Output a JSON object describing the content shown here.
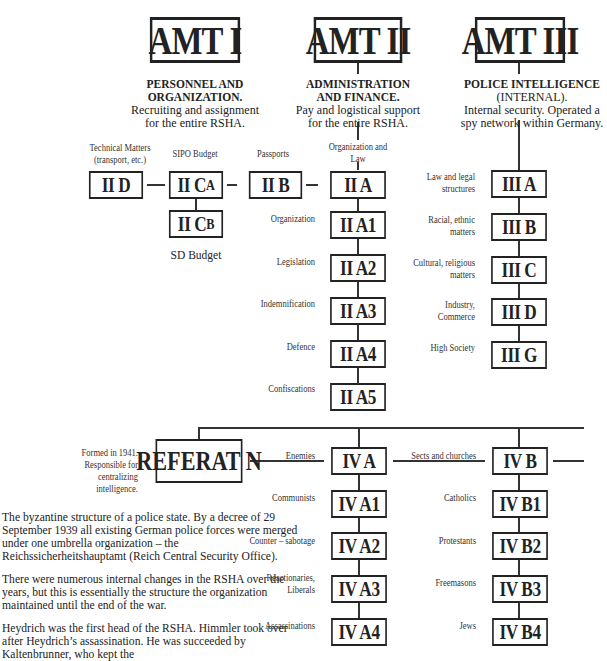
{
  "amts": [
    {
      "id": "amt1",
      "title": "AMT I",
      "heading": "PERSONNEL AND ORGANIZATION.",
      "heading_lines": [
        "PERSONNEL AND",
        "ORGANIZATION."
      ],
      "desc_lines": [
        "Recruiting and assignment",
        "for the entire RSHA."
      ]
    },
    {
      "id": "amt2",
      "title": "AMT II",
      "heading_lines": [
        "ADMINISTRATION",
        "AND FINANCE."
      ],
      "desc_lines": [
        "Pay and logistical support",
        "for the entire RSHA."
      ]
    },
    {
      "id": "amt3",
      "title": "AMT III",
      "heading_lines": [
        "POLICE INTELLIGENCE",
        "(INTERNAL)."
      ],
      "desc_lines": [
        "Internal security. Operated a",
        "spy network within Germany."
      ]
    }
  ],
  "amt2_units": {
    "row": [
      {
        "code": "II D",
        "label_lines": [
          "Technical Matters",
          "(transport, etc.)"
        ]
      },
      {
        "code": "II C",
        "sub": "A",
        "label_lines": [
          "SIPO Budget"
        ]
      },
      {
        "code": "II B",
        "label_lines": [
          "Passports"
        ]
      },
      {
        "code": "II A",
        "label_lines": [
          "Organization and",
          "Law"
        ]
      }
    ],
    "cb": {
      "code": "II C",
      "sub": "B",
      "label": "SD Budget"
    },
    "a_column": [
      {
        "code": "II A1",
        "label": "Organization"
      },
      {
        "code": "II A2",
        "label": "Legislation"
      },
      {
        "code": "II A3",
        "label": "Indemnification"
      },
      {
        "code": "II A4",
        "label": "Defence"
      },
      {
        "code": "II A5",
        "label": "Confiscations"
      }
    ]
  },
  "amt3_units": [
    {
      "code": "III A",
      "label_lines": [
        "Law and legal",
        "structures"
      ]
    },
    {
      "code": "III B",
      "label_lines": [
        "Racial, ethnic",
        "matters"
      ]
    },
    {
      "code": "III C",
      "label_lines": [
        "Cultural, religious",
        "matters"
      ]
    },
    {
      "code": "III D",
      "label_lines": [
        "Industry,",
        "Commerce"
      ]
    },
    {
      "code": "III G",
      "label_lines": [
        "High Society"
      ]
    }
  ],
  "referat": {
    "title": "REFERAT N",
    "note_lines": [
      "Formed in 1941.",
      "Responsible for centralizing",
      "intelligence."
    ]
  },
  "amt4_units": {
    "a": {
      "code": "IV A",
      "label": "Enemies",
      "children": [
        {
          "code": "IV A1",
          "label_lines": [
            "Communists"
          ]
        },
        {
          "code": "IV A2",
          "label_lines": [
            "Counter – sabotage"
          ]
        },
        {
          "code": "IV A3",
          "label_lines": [
            "Reactionaries,",
            "Liberals"
          ]
        },
        {
          "code": "IV A4",
          "label_lines": [
            "Assassinations"
          ]
        }
      ]
    },
    "b": {
      "code": "IV B",
      "label": "Sects and churches",
      "children": [
        {
          "code": "IV B1",
          "label_lines": [
            "Catholics"
          ]
        },
        {
          "code": "IV B2",
          "label_lines": [
            "Protestants"
          ]
        },
        {
          "code": "IV B3",
          "label_lines": [
            "Freemasons"
          ]
        },
        {
          "code": "IV B4",
          "label_lines": [
            "Jews"
          ]
        }
      ]
    }
  },
  "caption": {
    "paragraphs": [
      "The byzantine structure of a police state. By a decree of 29 September 1939 all existing German police forces were merged under one umbrella organization – the Reichssicherheitshauptamt (Reich Central Security Office).",
      "There were numerous internal changes in the RSHA over the years, but this is essentially the structure the organization maintained until the end of the war.",
      "Heydrich was the first head of the RSHA. Himmler took over after Heydrich’s assassination. He was succeeded by Kaltenbrunner, who kept the"
    ]
  }
}
